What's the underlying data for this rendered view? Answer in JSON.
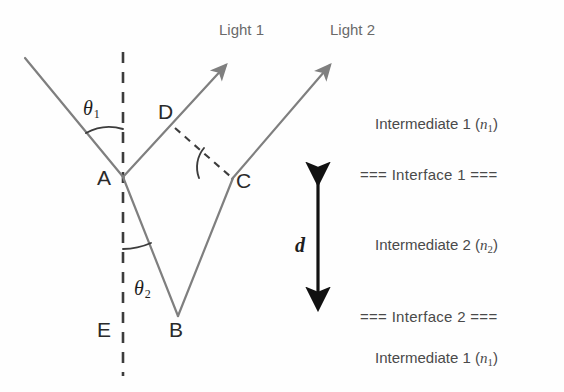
{
  "figure": {
    "background_color": "#fefefe",
    "ray_color": "#7f7f7f",
    "dash_color": "#3c3c3c",
    "text_color": "#4a4a4a"
  },
  "labels": {
    "light1": "Light 1",
    "light2": "Light 2",
    "point_a": "A",
    "point_b": "B",
    "point_c": "C",
    "point_d": "D",
    "point_e": "E",
    "theta1_symbol": "θ",
    "theta1_sub": "1",
    "theta2_symbol": "θ",
    "theta2_sub": "2",
    "thickness_symbol": "d"
  },
  "media": {
    "top": {
      "name": "Intermediate 1",
      "index_symbol": "n",
      "index_sub": "1"
    },
    "middle": {
      "name": "Intermediate 2",
      "index_symbol": "n",
      "index_sub": "2"
    },
    "bottom": {
      "name": "Intermediate 1",
      "index_symbol": "n",
      "index_sub": "1"
    }
  },
  "interfaces": {
    "top": "=== Interface 1 ===",
    "bottom": "=== Interface 2 ==="
  },
  "geometry": {
    "point_a": [
      123,
      177
    ],
    "point_b": [
      178,
      315
    ],
    "point_c": [
      232,
      179
    ],
    "point_d": [
      178,
      131
    ],
    "point_e": [
      123,
      340
    ],
    "incident_start": [
      25,
      58
    ],
    "light1_tip": [
      229,
      62
    ],
    "light2_tip": [
      333,
      62
    ],
    "normal_top": [
      123,
      52
    ],
    "normal_bottom": [
      123,
      376
    ],
    "thickness_arrow_x": 318,
    "thickness_arrow_top": 178,
    "thickness_arrow_bottom": 311
  }
}
